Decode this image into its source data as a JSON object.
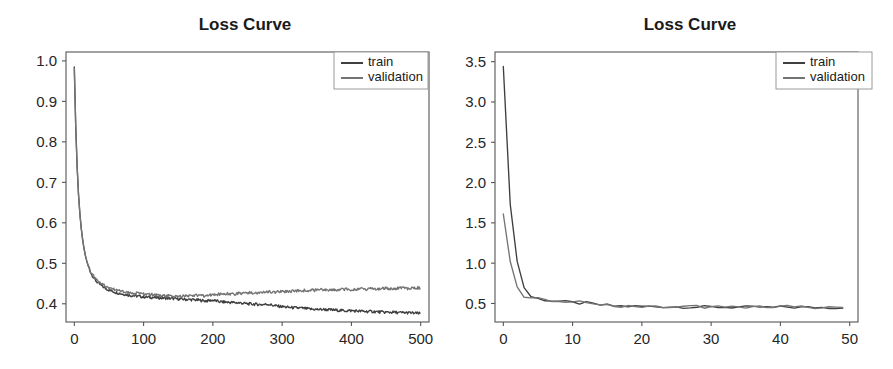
{
  "figure": {
    "width": 893,
    "height": 369,
    "background": "#ffffff",
    "panel_count": 2
  },
  "colors": {
    "train": "#3f3f3f",
    "validation": "#747474",
    "axis": "#555555",
    "text": "#1a1a1a",
    "legend_border": "#9a9a9a",
    "background": "#ffffff"
  },
  "chart_data": [
    {
      "id": "loss-curve-500-epochs",
      "type": "line",
      "title": "Loss Curve",
      "xlabel": "",
      "ylabel": "",
      "grid": false,
      "legend_position": "upper right",
      "xlim": [
        -12,
        512
      ],
      "ylim": [
        0.355,
        1.022
      ],
      "xticks": [
        0,
        100,
        200,
        300,
        400,
        500
      ],
      "xtick_labels": [
        "0",
        "100",
        "200",
        "300",
        "400",
        "500"
      ],
      "yticks": [
        0.4,
        0.5,
        0.6,
        0.7,
        0.8,
        0.9,
        1.0
      ],
      "ytick_labels": [
        "0.4",
        "0.5",
        "0.6",
        "0.7",
        "0.8",
        "0.9",
        "1.0"
      ],
      "series": [
        {
          "name": "train",
          "color": "#3f3f3f",
          "x": [
            0,
            2,
            4,
            6,
            8,
            10,
            12,
            14,
            16,
            18,
            20,
            24,
            28,
            32,
            36,
            40,
            45,
            50,
            55,
            60,
            65,
            70,
            75,
            80,
            85,
            90,
            95,
            100,
            110,
            120,
            130,
            140,
            150,
            160,
            170,
            180,
            190,
            200,
            210,
            220,
            230,
            240,
            250,
            260,
            270,
            280,
            290,
            300,
            310,
            320,
            330,
            340,
            350,
            360,
            370,
            380,
            390,
            400,
            410,
            420,
            430,
            440,
            450,
            460,
            470,
            480,
            490,
            499
          ],
          "values": [
            0.985,
            0.842,
            0.742,
            0.672,
            0.624,
            0.587,
            0.559,
            0.537,
            0.519,
            0.505,
            0.494,
            0.476,
            0.464,
            0.455,
            0.449,
            0.444,
            0.438,
            0.434,
            0.431,
            0.428,
            0.426,
            0.424,
            0.423,
            0.421,
            0.42,
            0.419,
            0.418,
            0.417,
            0.416,
            0.415,
            0.414,
            0.413,
            0.412,
            0.411,
            0.41,
            0.409,
            0.407,
            0.409,
            0.405,
            0.404,
            0.403,
            0.402,
            0.4,
            0.399,
            0.398,
            0.399,
            0.395,
            0.393,
            0.391,
            0.39,
            0.389,
            0.387,
            0.386,
            0.386,
            0.385,
            0.384,
            0.383,
            0.383,
            0.382,
            0.381,
            0.381,
            0.38,
            0.379,
            0.379,
            0.378,
            0.378,
            0.377,
            0.376
          ]
        },
        {
          "name": "validation",
          "color": "#747474",
          "x": [
            0,
            2,
            4,
            6,
            8,
            10,
            12,
            14,
            16,
            18,
            20,
            24,
            28,
            32,
            36,
            40,
            45,
            50,
            55,
            60,
            65,
            70,
            75,
            80,
            85,
            90,
            95,
            100,
            110,
            120,
            130,
            140,
            150,
            160,
            170,
            180,
            190,
            200,
            210,
            220,
            230,
            240,
            250,
            260,
            270,
            280,
            290,
            300,
            310,
            320,
            330,
            340,
            350,
            360,
            370,
            380,
            390,
            400,
            410,
            420,
            430,
            440,
            450,
            460,
            470,
            480,
            490,
            499
          ],
          "values": [
            0.982,
            0.84,
            0.741,
            0.671,
            0.623,
            0.586,
            0.558,
            0.536,
            0.519,
            0.506,
            0.495,
            0.478,
            0.467,
            0.459,
            0.453,
            0.448,
            0.443,
            0.439,
            0.437,
            0.434,
            0.432,
            0.431,
            0.429,
            0.428,
            0.427,
            0.426,
            0.425,
            0.424,
            0.423,
            0.421,
            0.42,
            0.419,
            0.418,
            0.419,
            0.42,
            0.421,
            0.419,
            0.424,
            0.423,
            0.425,
            0.424,
            0.426,
            0.428,
            0.426,
            0.428,
            0.43,
            0.429,
            0.431,
            0.43,
            0.432,
            0.433,
            0.433,
            0.434,
            0.435,
            0.434,
            0.435,
            0.436,
            0.435,
            0.437,
            0.436,
            0.438,
            0.437,
            0.438,
            0.437,
            0.439,
            0.438,
            0.44,
            0.439
          ]
        }
      ],
      "legend_entries": [
        {
          "label": "train",
          "color": "#3f3f3f"
        },
        {
          "label": "validation",
          "color": "#747474"
        }
      ]
    },
    {
      "id": "loss-curve-50-epochs",
      "type": "line",
      "title": "Loss Curve",
      "xlabel": "",
      "ylabel": "",
      "grid": false,
      "legend_position": "upper right",
      "xlim": [
        -1.2,
        51.2
      ],
      "ylim": [
        0.27,
        3.62
      ],
      "xticks": [
        0,
        10,
        20,
        30,
        40,
        50
      ],
      "xtick_labels": [
        "0",
        "10",
        "20",
        "30",
        "40",
        "50"
      ],
      "yticks": [
        0.5,
        1.0,
        1.5,
        2.0,
        2.5,
        3.0,
        3.5
      ],
      "ytick_labels": [
        "0.5",
        "1.0",
        "1.5",
        "2.0",
        "2.5",
        "3.0",
        "3.5"
      ],
      "series": [
        {
          "name": "train",
          "color": "#3f3f3f",
          "x": [
            0,
            1,
            2,
            3,
            4,
            5,
            6,
            7,
            8,
            9,
            10,
            11,
            12,
            13,
            14,
            15,
            16,
            17,
            18,
            19,
            20,
            21,
            22,
            23,
            24,
            25,
            26,
            27,
            28,
            29,
            30,
            31,
            32,
            33,
            34,
            35,
            36,
            37,
            38,
            39,
            40,
            41,
            42,
            43,
            44,
            45,
            46,
            47,
            48,
            49
          ],
          "values": [
            3.44,
            1.73,
            1.02,
            0.7,
            0.585,
            0.558,
            0.545,
            0.535,
            0.527,
            0.518,
            0.51,
            0.503,
            0.506,
            0.492,
            0.482,
            0.475,
            0.47,
            0.467,
            0.464,
            0.462,
            0.463,
            0.461,
            0.46,
            0.462,
            0.459,
            0.458,
            0.457,
            0.457,
            0.456,
            0.456,
            0.455,
            0.455,
            0.454,
            0.454,
            0.454,
            0.453,
            0.453,
            0.455,
            0.452,
            0.452,
            0.453,
            0.456,
            0.452,
            0.451,
            0.451,
            0.451,
            0.45,
            0.45,
            0.45,
            0.449
          ]
        },
        {
          "name": "validation",
          "color": "#747474",
          "x": [
            0,
            1,
            2,
            3,
            4,
            5,
            6,
            7,
            8,
            9,
            10,
            11,
            12,
            13,
            14,
            15,
            16,
            17,
            18,
            19,
            20,
            21,
            22,
            23,
            24,
            25,
            26,
            27,
            28,
            29,
            30,
            31,
            32,
            33,
            34,
            35,
            36,
            37,
            38,
            39,
            40,
            41,
            42,
            43,
            44,
            45,
            46,
            47,
            48,
            49
          ],
          "values": [
            1.61,
            1.02,
            0.72,
            0.575,
            0.565,
            0.555,
            0.545,
            0.538,
            0.531,
            0.523,
            0.515,
            0.522,
            0.497,
            0.488,
            0.48,
            0.474,
            0.47,
            0.467,
            0.465,
            0.463,
            0.462,
            0.461,
            0.461,
            0.46,
            0.459,
            0.458,
            0.458,
            0.457,
            0.457,
            0.456,
            0.456,
            0.455,
            0.455,
            0.455,
            0.454,
            0.454,
            0.454,
            0.46,
            0.453,
            0.453,
            0.455,
            0.459,
            0.453,
            0.452,
            0.452,
            0.451,
            0.451,
            0.451,
            0.45,
            0.45
          ]
        }
      ],
      "legend_entries": [
        {
          "label": "train",
          "color": "#3f3f3f"
        },
        {
          "label": "validation",
          "color": "#747474"
        }
      ]
    }
  ],
  "layout": {
    "left_panel": {
      "plot_x0": 66,
      "plot_x1": 429,
      "plot_y0": 52,
      "plot_y1": 322,
      "title_x": 245,
      "title_y": 30,
      "legend_x": 334,
      "legend_y": 52,
      "legend_w": 94,
      "legend_h": 37
    },
    "right_panel": {
      "plot_x0": 495,
      "plot_x1": 858,
      "plot_y0": 52,
      "plot_y1": 322,
      "title_x": 690,
      "title_y": 30,
      "legend_x": 776,
      "legend_y": 52,
      "legend_w": 96,
      "legend_h": 37
    }
  }
}
